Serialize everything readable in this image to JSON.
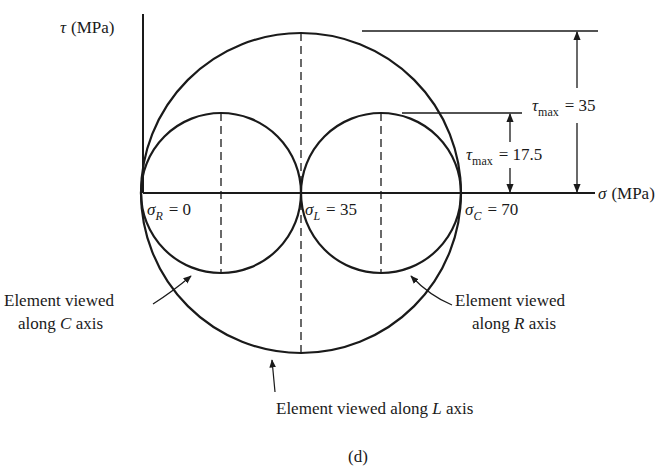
{
  "diagram": {
    "type": "mohr_circles",
    "caption": "(d)",
    "axes": {
      "y_label_symbol": "τ",
      "y_label_unit": "(MPa)",
      "x_label_symbol": "σ",
      "x_label_unit": "(MPa)"
    },
    "points": [
      {
        "symbol": "σ",
        "subscript": "R",
        "eq": "= 0",
        "value": 0
      },
      {
        "symbol": "σ",
        "subscript": "L",
        "eq": "= 35",
        "value": 35
      },
      {
        "symbol": "σ",
        "subscript": "C",
        "eq": "= 70",
        "value": 70
      }
    ],
    "dimensions": [
      {
        "symbol": "τ",
        "subscript": "max",
        "eq": "= 35",
        "value": 35
      },
      {
        "symbol": "τ",
        "subscript": "max",
        "eq": "= 17.5",
        "value": 17.5
      }
    ],
    "annotations": {
      "c_axis": {
        "line1": "Element viewed",
        "line2_pre": "along ",
        "line2_ital": "C",
        "line2_post": " axis"
      },
      "r_axis": {
        "line1": "Element viewed",
        "line2_pre": "along ",
        "line2_ital": "R",
        "line2_post": " axis"
      },
      "l_axis": {
        "pre": "Element viewed along ",
        "ital": "L",
        "post": " axis"
      }
    },
    "circles": [
      {
        "name": "Element viewed along C axis",
        "center": 17.5,
        "radius": 17.5
      },
      {
        "name": "Element viewed along R axis",
        "center": 52.5,
        "radius": 17.5
      },
      {
        "name": "Element viewed along L axis",
        "center": 35,
        "radius": 35
      }
    ],
    "colors": {
      "ink": "#1a1a1a",
      "background": "#ffffff"
    }
  }
}
